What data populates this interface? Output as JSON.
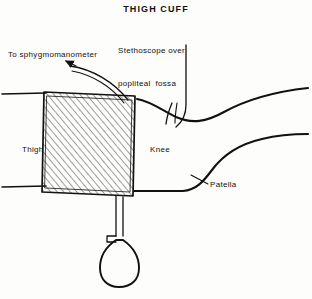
{
  "figure": {
    "title": "THIGH CUFF",
    "domain": "medical-illustration",
    "ink_color": "#111111",
    "background_color": "#fdfdfb",
    "hatch_color": "#555555"
  },
  "labels": {
    "stethoscope": "Stethoscope over\npopliteal  fossa",
    "stethoscope_line1": "Stethoscope over",
    "stethoscope_line2": "popliteal  fossa",
    "sphygmomanometer": "To sphygmomanometer",
    "thigh": "Thigh",
    "knee": "Knee",
    "patella": "Patella"
  },
  "parts": {
    "cuff": "thigh-cuff-hatched",
    "bulb": "inflation-bulb",
    "valve": "bulb-valve-knob",
    "tubes": "sphygmomanometer-tubing",
    "arrow": "tubing-direction-arrow",
    "steth_tubing": "stethoscope-tubing",
    "leg_upper": "upper-leg-contour",
    "leg_lower": "lower-leg-contour",
    "patella_leader": "patella-leader-line"
  }
}
